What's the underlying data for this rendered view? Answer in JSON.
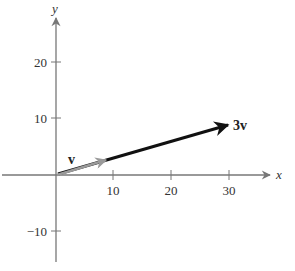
{
  "diagram": {
    "type": "vector-plot",
    "axes": {
      "x_label": "x",
      "y_label": "y",
      "x_ticks": [
        {
          "value": 10,
          "label": "10"
        },
        {
          "value": 20,
          "label": "20"
        },
        {
          "value": 30,
          "label": "30"
        }
      ],
      "y_ticks": [
        {
          "value": 20,
          "label": "20"
        },
        {
          "value": 10,
          "label": "10"
        },
        {
          "value": -10,
          "label": "−10"
        }
      ],
      "xlim": [
        0,
        37
      ],
      "ylim": [
        -13,
        27
      ]
    },
    "vectors": [
      {
        "name": "v",
        "label": "v",
        "from": [
          0,
          0
        ],
        "to": [
          10,
          3
        ],
        "color": "#9a9a9a"
      },
      {
        "name": "3v",
        "label": "3v",
        "from": [
          0,
          0
        ],
        "to": [
          30,
          9
        ],
        "color": "#111111"
      }
    ],
    "colors": {
      "axis": "#777777",
      "text": "#333333",
      "v_vector": "#9a9a9a",
      "three_v_vector": "#111111"
    }
  }
}
